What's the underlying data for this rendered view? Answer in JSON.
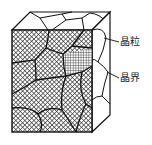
{
  "diagram": {
    "labels": {
      "grain": "晶粒",
      "grain_boundary": "晶界"
    },
    "colors": {
      "line": "#111111",
      "hatch": "#333333",
      "background": "#ffffff"
    }
  }
}
